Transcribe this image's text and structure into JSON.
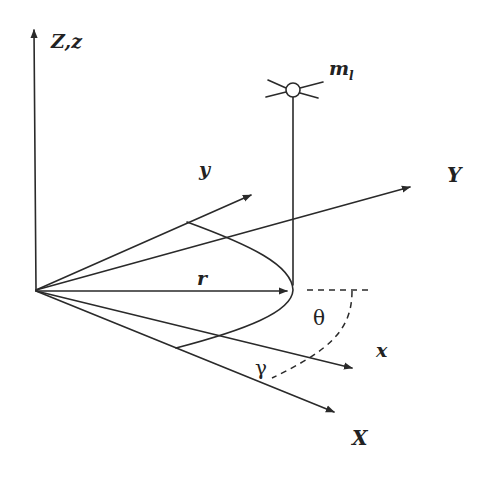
{
  "figure": {
    "type": "3D coordinate frame diagram",
    "stroke_color": "#2a2a2a",
    "background": "#ffffff"
  },
  "labels": {
    "Z_axis": "Z,z",
    "Y_axis": "Y",
    "X_axis": "X",
    "y_axis": "y",
    "x_axis": "x",
    "radius": "r",
    "mass_main": "m",
    "mass_sub": "l",
    "theta": "θ",
    "gamma": "γ"
  }
}
